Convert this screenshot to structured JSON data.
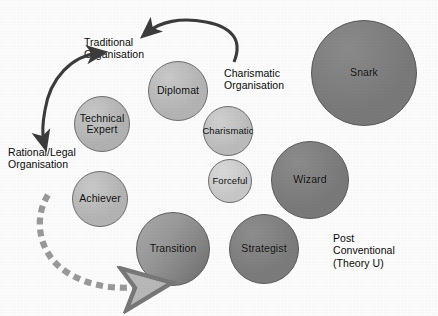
{
  "diagram": {
    "background_color": "#fdfdfd",
    "captions": [
      {
        "id": "traditional",
        "text": "Traditional\nOrganisation",
        "x": 84,
        "y": 36,
        "size": 10.5
      },
      {
        "id": "charismatic_org",
        "text": "Charismatic\nOrganisation",
        "x": 224,
        "y": 67,
        "size": 10.5
      },
      {
        "id": "rational_legal",
        "text": "Rational/Legal\nOrganisation",
        "x": 8,
        "y": 146,
        "size": 10.5
      },
      {
        "id": "post_conventional",
        "text": "Post\nConventional\n(Theory U)",
        "x": 333,
        "y": 232,
        "size": 10.5
      }
    ],
    "nodes": [
      {
        "id": "diplomat",
        "label": "Diplomat",
        "cx": 178,
        "cy": 91,
        "r": 30,
        "fill": "#b4b4b4",
        "font_size": 10.5,
        "shade": "medium"
      },
      {
        "id": "technical-expert",
        "label": "Technical\nExpert",
        "cx": 102,
        "cy": 124,
        "r": 28,
        "fill": "#b2b2b2",
        "font_size": 10.5,
        "shade": "medium"
      },
      {
        "id": "charismatic",
        "label": "Charismatic",
        "cx": 228,
        "cy": 131,
        "r": 25,
        "fill": "#bcbcbc",
        "font_size": 9.5,
        "shade": "medium-light"
      },
      {
        "id": "forceful",
        "label": "Forceful",
        "cx": 230,
        "cy": 181,
        "r": 22,
        "fill": "#c8c8c8",
        "font_size": 9.5,
        "shade": "light"
      },
      {
        "id": "achiever",
        "label": "Achiever",
        "cx": 100,
        "cy": 199,
        "r": 28,
        "fill": "#b4b4b4",
        "font_size": 10.5,
        "shade": "medium"
      },
      {
        "id": "transition",
        "label": "Transition",
        "cx": 173,
        "cy": 249,
        "r": 37,
        "fill": "#8f8f8f",
        "font_size": 10.5,
        "shade": "gradient"
      },
      {
        "id": "strategist",
        "label": "Strategist",
        "cx": 264,
        "cy": 249,
        "r": 35,
        "fill": "#7c7c7c",
        "font_size": 10.5,
        "shade": "dark"
      },
      {
        "id": "wizard",
        "label": "Wizard",
        "cx": 310,
        "cy": 180,
        "r": 39,
        "fill": "#7a7a7a",
        "font_size": 10.5,
        "shade": "dark"
      },
      {
        "id": "snark",
        "label": "Snark",
        "cx": 364,
        "cy": 73,
        "r": 53,
        "fill": "#7a7a7a",
        "font_size": 10.5,
        "shade": "dark"
      }
    ],
    "arrows": [
      {
        "id": "traditional-to-rational-legal",
        "style": "solid",
        "color": "#3c3c3c",
        "heads": "both",
        "description": "double-headed curved arrow on the left linking Traditional Organisation and Rational/Legal Organisation"
      },
      {
        "id": "charismatic-to-traditional",
        "style": "solid",
        "color": "#3c3c3c",
        "heads": "both",
        "description": "curved arrow across the top linking Charismatic Organisation and Traditional Organisation"
      },
      {
        "id": "rational-legal-to-transition",
        "style": "dashed",
        "color": "#8c8c8c",
        "heads": "end",
        "description": "dashed curved arrow sweeping from Rational/Legal Organisation down and right into the Transition circle"
      }
    ]
  }
}
